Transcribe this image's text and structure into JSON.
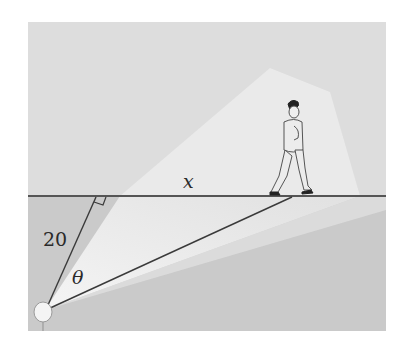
{
  "figure": {
    "labels": {
      "x": "x",
      "distance": "20",
      "angle": "θ"
    },
    "colors": {
      "wall": "#dcdcdc",
      "ground": "#c9c9c9",
      "beam": "#f2f2f2",
      "line": "#3a3a3a",
      "horizon": "#555555"
    }
  }
}
